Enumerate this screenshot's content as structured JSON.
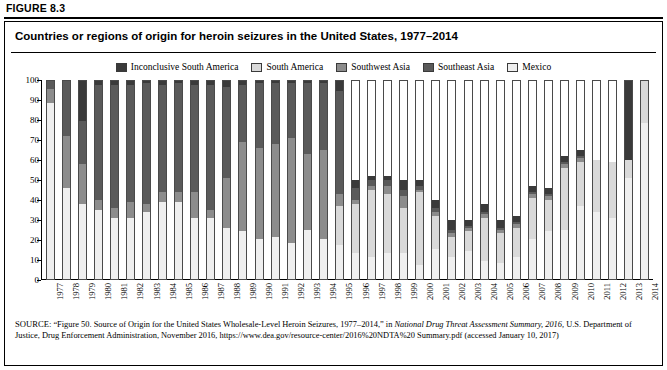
{
  "figure_label": "FIGURE 8.3",
  "title": "Countries or regions of origin for heroin seizures in the United States, 1977–2014",
  "legend": [
    {
      "label": "Inconclusive South America",
      "color": "#3a3a3a"
    },
    {
      "label": "South America",
      "color": "#d9d9d9"
    },
    {
      "label": "Southwest Asia",
      "color": "#8c8c8c"
    },
    {
      "label": "Southeast Asia",
      "color": "#5a5a5a"
    },
    {
      "label": "Mexico",
      "color": "#efefef"
    }
  ],
  "source": {
    "label": "SOURCE:",
    "line1": "“Figure 50. Source of Origin for the United States Wholesale-Level Heroin Seizures, 1977–2014,” in ",
    "italic1": "National Drug Threat Assessment Summary,",
    "italic2": "2016,",
    "line2": " U.S. Department of Justice, Drug Enforcement Administration, November 2016, https://www.dea.gov/resource-center/2016%20NDTA%20",
    "line3": "Summary.pdf (accessed January 10, 2017)"
  },
  "chart_data": {
    "type": "bar",
    "stacked": true,
    "title": "Countries or regions of origin for heroin seizures in the United States, 1977–2014",
    "xlabel": "",
    "ylabel": "",
    "ylim": [
      0,
      100
    ],
    "yticks": [
      0,
      10,
      20,
      30,
      40,
      50,
      60,
      70,
      80,
      90,
      100
    ],
    "grid": false,
    "legend_position": "top-center",
    "categories": [
      "1977",
      "1978",
      "1979",
      "1980",
      "1981",
      "1982",
      "1983",
      "1984",
      "1985",
      "1986",
      "1987",
      "1988",
      "1989",
      "1990",
      "1991",
      "1992",
      "1993",
      "1994",
      "1995",
      "1996",
      "1997",
      "1998",
      "1999",
      "2000",
      "2001",
      "2002",
      "2003",
      "2004",
      "2005",
      "2006",
      "2007",
      "2008",
      "2009",
      "2010",
      "2011",
      "2012",
      "2013",
      "2014"
    ],
    "series": [
      {
        "name": "Mexico",
        "color": "#efefef",
        "values": [
          89,
          46,
          38,
          35,
          31,
          31,
          34,
          39,
          39,
          31,
          31,
          26,
          24,
          20,
          21,
          18,
          25,
          20,
          17,
          13,
          11,
          13,
          13,
          7,
          15,
          11,
          14,
          9,
          8,
          11,
          20,
          24,
          25,
          37,
          34,
          31,
          51,
          79
        ]
      },
      {
        "name": "South America",
        "color": "#d9d9d9",
        "values": [
          0,
          0,
          0,
          0,
          0,
          0,
          0,
          0,
          0,
          0,
          0,
          0,
          0,
          0,
          0,
          0,
          0,
          0,
          20,
          25,
          34,
          30,
          23,
          37,
          17,
          10,
          10,
          22,
          15,
          15,
          21,
          16,
          31,
          22,
          26,
          28,
          9,
          21
        ]
      },
      {
        "name": "Southwest Asia",
        "color": "#8c8c8c",
        "values": [
          7,
          26,
          20,
          5,
          5,
          8,
          4,
          5,
          5,
          13,
          4,
          25,
          45,
          46,
          47,
          53,
          38,
          45,
          6,
          2,
          2,
          4,
          6,
          1,
          2,
          2,
          2,
          2,
          2,
          2,
          2,
          2,
          2,
          2,
          0,
          0,
          0,
          0
        ]
      },
      {
        "name": "Southeast Asia",
        "color": "#5a5a5a",
        "values": [
          4,
          28,
          22,
          58,
          62,
          59,
          61,
          54,
          55,
          54,
          63,
          46,
          29,
          33,
          31,
          28,
          36,
          34,
          52,
          6,
          3,
          3,
          3,
          2,
          2,
          2,
          1,
          1,
          1,
          1,
          1,
          1,
          1,
          1,
          0,
          0,
          0,
          0
        ]
      },
      {
        "name": "Inconclusive South America",
        "color": "#3a3a3a",
        "values": [
          0,
          0,
          20,
          2,
          2,
          2,
          1,
          2,
          1,
          2,
          2,
          3,
          2,
          1,
          1,
          1,
          1,
          1,
          5,
          4,
          2,
          2,
          5,
          3,
          4,
          5,
          3,
          4,
          4,
          3,
          3,
          3,
          3,
          3,
          0,
          0,
          40,
          0
        ]
      }
    ]
  }
}
